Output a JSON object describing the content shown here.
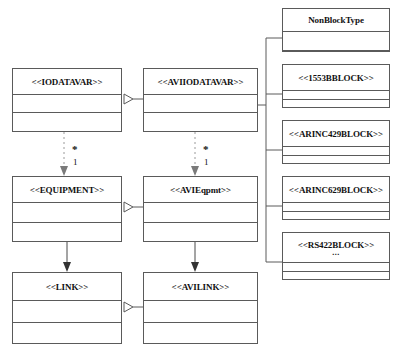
{
  "diagram": {
    "kind": "uml-class-diagram",
    "background_color": "#ffffff",
    "line_color": "#5a5a5a",
    "text_color": "#111111"
  },
  "classes": [
    {
      "id": "iodatavar",
      "name": "<<IODATAVAR>>",
      "column": "left",
      "row": "top",
      "x": 12,
      "y": 68,
      "w": 110,
      "h": 64,
      "name_h": 26,
      "attr_h": 18,
      "sub": ""
    },
    {
      "id": "aviiodatavar",
      "name": "<<AVIIODATAVAR>>",
      "column": "middle",
      "row": "top",
      "x": 143,
      "y": 68,
      "w": 115,
      "h": 64,
      "name_h": 26,
      "attr_h": 18,
      "sub": ""
    },
    {
      "id": "equipment",
      "name": "<<EQUIPMENT>>",
      "column": "left",
      "row": "middle",
      "x": 12,
      "y": 176,
      "w": 110,
      "h": 66,
      "name_h": 26,
      "attr_h": 20,
      "sub": ""
    },
    {
      "id": "avieqpmt",
      "name": "<<AVIEqpmt>>",
      "column": "middle",
      "row": "middle",
      "x": 143,
      "y": 176,
      "w": 115,
      "h": 66,
      "name_h": 26,
      "attr_h": 20,
      "sub": ""
    },
    {
      "id": "link",
      "name": "<<LINK>>",
      "column": "left",
      "row": "bottom",
      "x": 12,
      "y": 272,
      "w": 110,
      "h": 72,
      "name_h": 28,
      "attr_h": 22,
      "sub": ""
    },
    {
      "id": "avilink",
      "name": "<<AVILINK>>",
      "column": "middle",
      "row": "bottom",
      "x": 143,
      "y": 272,
      "w": 115,
      "h": 72,
      "name_h": 28,
      "attr_h": 22,
      "sub": ""
    },
    {
      "id": "nonblocktype",
      "name": "NonBlockType",
      "column": "right",
      "row": "r1",
      "x": 282,
      "y": 8,
      "w": 108,
      "h": 44,
      "name_h": 24,
      "attr_h": 20,
      "sub": ""
    },
    {
      "id": "b1553bblock",
      "name": "<<1553BBLOCK>>",
      "column": "right",
      "row": "r2",
      "x": 282,
      "y": 64,
      "w": 108,
      "h": 44,
      "name_h": 26,
      "attr_h": 9,
      "sub": ""
    },
    {
      "id": "arinc429block",
      "name": "<<ARINC429BLOCK>>",
      "column": "right",
      "row": "r3",
      "x": 282,
      "y": 120,
      "w": 108,
      "h": 44,
      "name_h": 26,
      "attr_h": 9,
      "sub": ""
    },
    {
      "id": "arinc629block",
      "name": "<<ARINC629BLOCK>>",
      "column": "right",
      "row": "r4",
      "x": 282,
      "y": 176,
      "w": 108,
      "h": 44,
      "name_h": 26,
      "attr_h": 9,
      "sub": ""
    },
    {
      "id": "rs422block",
      "name": "<<RS422BLOCK>>",
      "column": "right",
      "row": "r5",
      "x": 282,
      "y": 232,
      "w": 108,
      "h": 48,
      "name_h": 30,
      "attr_h": 9,
      "sub": "..."
    }
  ],
  "multiplicities": [
    {
      "id": "m1-star",
      "label": "*",
      "x": 72,
      "y": 145
    },
    {
      "id": "m1-one",
      "label": "1",
      "x": 73,
      "y": 158
    },
    {
      "id": "m2-star",
      "label": "*",
      "x": 203,
      "y": 145
    },
    {
      "id": "m2-one",
      "label": "1",
      "x": 204,
      "y": 158
    }
  ],
  "relationships": [
    {
      "id": "gen-aviiodatavar-iodatavar",
      "type": "generalization",
      "from": "aviiodatavar",
      "to": "iodatavar"
    },
    {
      "id": "gen-avieqpmt-equipment",
      "type": "generalization",
      "from": "avieqpmt",
      "to": "equipment"
    },
    {
      "id": "gen-avilink-link",
      "type": "generalization",
      "from": "avilink",
      "to": "link"
    },
    {
      "id": "dep-iodatavar-equipment",
      "type": "dependency",
      "from": "iodatavar",
      "to": "equipment",
      "source_mult": "*",
      "target_mult": "1"
    },
    {
      "id": "dep-aviiodatavar-avieqpmt",
      "type": "dependency",
      "from": "aviiodatavar",
      "to": "avieqpmt",
      "source_mult": "*",
      "target_mult": "1"
    },
    {
      "id": "assoc-equipment-link",
      "type": "association",
      "from": "equipment",
      "to": "link"
    },
    {
      "id": "assoc-avieqpmt-avilink",
      "type": "association",
      "from": "avieqpmt",
      "to": "avilink"
    },
    {
      "id": "tree-aviiodatavar-blocks",
      "type": "shared-tree",
      "from": "aviiodatavar",
      "to": [
        "nonblocktype",
        "b1553bblock",
        "arinc429block",
        "arinc629block",
        "rs422block"
      ]
    }
  ]
}
